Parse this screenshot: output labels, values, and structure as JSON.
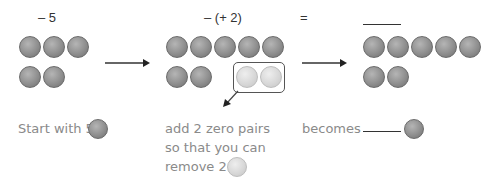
{
  "steps": [
    {
      "expression": "– 5",
      "dark_counters": 5,
      "caption_lines": [
        "Start with 5"
      ],
      "caption_counter": "dark"
    },
    {
      "expression": "– (+ 2)",
      "dark_counters": 7,
      "light_counters_boxed": 2,
      "caption_lines": [
        "add 2 zero pairs",
        "so that you can",
        "remove 2"
      ],
      "caption_counter": "light"
    },
    {
      "expression": "=",
      "answer_blank": "______",
      "dark_counters": 7,
      "caption_lines": [
        "becomes"
      ],
      "caption_blank": "______",
      "caption_counter": "dark"
    }
  ],
  "arrows": [
    "right-arrow",
    "right-arrow",
    "diagonal-down-left-arrow"
  ],
  "colors": {
    "dark_counter": "#8f8f8f",
    "light_counter": "#d6d6d6",
    "caption_text": "#8a8a8a"
  }
}
